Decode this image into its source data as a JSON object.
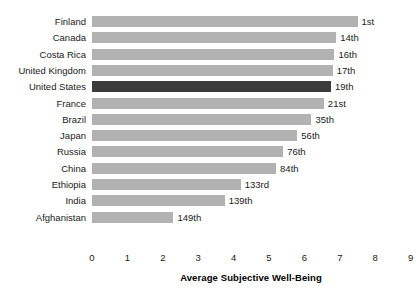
{
  "chart_data": {
    "type": "bar",
    "orientation": "horizontal",
    "title": "",
    "subtitle": "",
    "xlabel": "Average Subjective Well-Being",
    "ylabel": "",
    "xlim": [
      0,
      9
    ],
    "xticks": [
      0,
      1,
      2,
      3,
      4,
      5,
      6,
      7,
      8,
      9
    ],
    "xtick_labels": [
      "0",
      "1",
      "2",
      "3",
      "4",
      "5",
      "6",
      "7",
      "8",
      "9"
    ],
    "grid": false,
    "legend": false,
    "legend_position": "none",
    "categories": [
      "Finland",
      "Canada",
      "Costa Rica",
      "United Kingdom",
      "United States",
      "France",
      "Brazil",
      "Japan",
      "Russia",
      "China",
      "Ethiopia",
      "India",
      "Afghanistan"
    ],
    "values": [
      7.5,
      6.9,
      6.85,
      6.8,
      6.75,
      6.55,
      6.2,
      5.8,
      5.4,
      5.2,
      4.2,
      3.75,
      2.3
    ],
    "bar_labels": [
      "1st",
      "14th",
      "16th",
      "17th",
      "19th",
      "21st",
      "35th",
      "56th",
      "76th",
      "84th",
      "133rd",
      "139th",
      "149th"
    ],
    "highlight_category": "United States",
    "colors": {
      "bar": "#b2b2b2",
      "bar_highlight": "#3c3c3c",
      "text": "#1a1a1a",
      "background": "#ffffff"
    }
  }
}
